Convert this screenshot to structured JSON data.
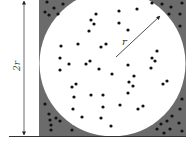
{
  "diagram": {
    "labels": {
      "side": "2r",
      "radius": "r"
    },
    "colors": {
      "square_fill": "#6b6b6b",
      "circle_fill": "#ffffff",
      "dot": "#111111",
      "line": "#222222"
    },
    "square": {
      "x": 39,
      "y": -10,
      "size": 147
    },
    "circle": {
      "cx": 112.5,
      "cy": 63.5,
      "r": 73
    },
    "radius_arrow": {
      "x1": 116,
      "y1": 57,
      "x2": 160,
      "y2": 16
    },
    "dots_inside": [
      [
        96,
        14
      ],
      [
        119,
        11
      ],
      [
        137,
        9
      ],
      [
        91,
        20
      ],
      [
        94,
        24
      ],
      [
        119,
        23
      ],
      [
        89,
        31
      ],
      [
        128,
        30
      ],
      [
        61,
        46
      ],
      [
        78,
        44
      ],
      [
        101,
        47
      ],
      [
        106,
        44
      ],
      [
        60,
        58
      ],
      [
        90,
        61
      ],
      [
        86,
        64
      ],
      [
        69,
        64
      ],
      [
        60,
        70
      ],
      [
        99,
        69
      ],
      [
        128,
        65
      ],
      [
        157,
        51
      ],
      [
        152,
        58
      ],
      [
        155,
        61
      ],
      [
        151,
        68
      ],
      [
        112,
        74
      ],
      [
        134,
        76
      ],
      [
        129,
        82
      ],
      [
        133,
        86
      ],
      [
        76,
        84
      ],
      [
        72,
        87
      ],
      [
        74,
        97
      ],
      [
        91,
        95
      ],
      [
        103,
        95
      ],
      [
        128,
        93
      ],
      [
        163,
        84
      ],
      [
        167,
        81
      ],
      [
        73,
        109
      ],
      [
        103,
        107
      ],
      [
        120,
        105
      ],
      [
        138,
        109
      ],
      [
        143,
        106
      ],
      [
        82,
        117
      ],
      [
        101,
        118
      ],
      [
        111,
        126
      ]
    ],
    "dots_outside": [
      [
        47,
        2
      ],
      [
        63,
        4
      ],
      [
        54,
        8
      ],
      [
        45,
        12
      ],
      [
        49,
        15
      ],
      [
        58,
        14
      ],
      [
        152,
        3
      ],
      [
        162,
        4
      ],
      [
        171,
        7
      ],
      [
        182,
        3
      ],
      [
        169,
        14
      ],
      [
        180,
        14
      ],
      [
        180,
        26
      ],
      [
        45,
        104
      ],
      [
        49,
        114
      ],
      [
        56,
        118
      ],
      [
        50,
        120
      ],
      [
        60,
        121
      ],
      [
        51,
        125
      ],
      [
        72,
        130
      ],
      [
        51,
        130
      ],
      [
        182,
        99
      ],
      [
        180,
        109
      ],
      [
        172,
        116
      ],
      [
        167,
        121
      ],
      [
        161,
        124
      ],
      [
        179,
        123
      ],
      [
        170,
        129
      ],
      [
        182,
        131
      ],
      [
        164,
        133
      ],
      [
        157,
        129
      ]
    ]
  }
}
